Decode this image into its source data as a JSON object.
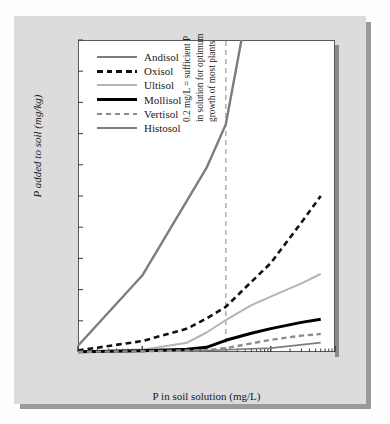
{
  "chart_data": {
    "type": "line",
    "title": "",
    "xlabel": "P in soil solution (mg/L)",
    "ylabel": "P added to soil (mg/kg)",
    "xscale": "log",
    "xlim": [
      0.001,
      10.0
    ],
    "ylim": [
      0,
      2000
    ],
    "xticks": [
      "0.001",
      "0.010",
      "0.100",
      "1.000",
      "10.000"
    ],
    "xtick_values": [
      0.001,
      0.01,
      0.1,
      1.0,
      10.0
    ],
    "yticks": [
      "0",
      "200",
      "400",
      "600",
      "800",
      "1000",
      "1200",
      "1400",
      "1600",
      "1800",
      "2000"
    ],
    "ytick_values": [
      0,
      200,
      400,
      600,
      800,
      1000,
      1200,
      1400,
      1600,
      1800,
      2000
    ],
    "grid": false,
    "legend_position": "upper-left",
    "series": [
      {
        "name": "Andisol",
        "style": "solid",
        "color": "#7d7d7d",
        "width": 1.6,
        "x": [
          0.001,
          0.01,
          0.1,
          1.0,
          6.0
        ],
        "values": [
          2,
          5,
          10,
          25,
          60
        ]
      },
      {
        "name": "Oxisol",
        "style": "dashed",
        "color": "#111111",
        "width": 2.6,
        "x": [
          0.001,
          0.01,
          0.05,
          0.1,
          0.2,
          0.5,
          1.0,
          3.0,
          6.0
        ],
        "values": [
          10,
          70,
          150,
          215,
          290,
          450,
          570,
          830,
          1000
        ]
      },
      {
        "name": "Ultisol",
        "style": "solid",
        "color": "#b4b4b4",
        "width": 2.0,
        "x": [
          0.001,
          0.01,
          0.05,
          0.1,
          0.2,
          0.5,
          1.0,
          3.0,
          6.0
        ],
        "values": [
          2,
          15,
          60,
          125,
          205,
          300,
          355,
          440,
          500
        ]
      },
      {
        "name": "Mollisol",
        "style": "solid",
        "color": "#000000",
        "width": 3.0,
        "x": [
          0.001,
          0.01,
          0.05,
          0.1,
          0.2,
          0.5,
          1.0,
          3.0,
          6.0
        ],
        "values": [
          2,
          8,
          18,
          30,
          75,
          120,
          150,
          190,
          210
        ]
      },
      {
        "name": "Vertisol",
        "style": "dashed",
        "color": "#8c8c8c",
        "width": 2.4,
        "x": [
          0.001,
          0.01,
          0.1,
          0.2,
          0.5,
          1.0,
          3.0,
          6.0
        ],
        "values": [
          1,
          5,
          12,
          25,
          55,
          78,
          105,
          115
        ]
      },
      {
        "name": "Histosol",
        "style": "solid",
        "color": "#7d7d7d",
        "width": 2.4,
        "x": [
          0.001,
          0.01,
          0.1,
          0.2,
          0.35
        ],
        "values": [
          40,
          490,
          1180,
          1460,
          2000
        ]
      }
    ],
    "annotations": [
      {
        "name": "sufficient-p-threshold",
        "x_value": 0.2,
        "style": "dashed-vertical",
        "color": "#9a9a9a",
        "lines": [
          "0.2 mg/L = sufficient P",
          "in solution for optimum",
          "growth of most plants"
        ]
      }
    ]
  }
}
